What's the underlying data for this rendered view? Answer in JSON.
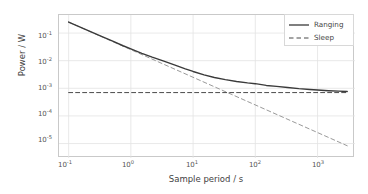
{
  "chart_data": {
    "type": "line",
    "title": "",
    "xlabel": "Sample period / s",
    "ylabel": "Power / W",
    "xscale": "log",
    "yscale": "log",
    "xlim": [
      0.07,
      4000
    ],
    "ylim": [
      3e-06,
      0.45
    ],
    "grid": true,
    "legend_position": "upper right",
    "xticks": [
      0.1,
      1,
      10,
      100,
      1000
    ],
    "xtick_labels": [
      "10⁻¹",
      "10⁰",
      "10¹",
      "10²",
      "10³"
    ],
    "xtick_mantissa": [
      "10",
      "10",
      "10",
      "10",
      "10"
    ],
    "xtick_exponent": [
      "-1",
      "0",
      "1",
      "2",
      "3"
    ],
    "yticks": [
      0.1,
      0.01,
      0.001,
      0.0001,
      1e-05
    ],
    "ytick_labels": [
      "10⁻¹",
      "10⁻²",
      "10⁻³",
      "10⁻⁴",
      "10⁻⁵"
    ],
    "ytick_mantissa": [
      "10",
      "10",
      "10",
      "10",
      "10"
    ],
    "ytick_exponent": [
      "-1",
      "-2",
      "-3",
      "-4",
      "-5"
    ],
    "series": [
      {
        "name": "Ranging",
        "style": "solid",
        "color": "#3a3a3a",
        "x": [
          0.1,
          0.15,
          0.22,
          0.33,
          0.5,
          0.75,
          1.0,
          1.5,
          2.2,
          3.3,
          5.0,
          7.5,
          10.0,
          15.0,
          22.0,
          33.0,
          50.0,
          75.0,
          100.0,
          150.0,
          220.0,
          330.0,
          500.0,
          750.0,
          1000.0,
          1500.0,
          2200.0,
          3000.0
        ],
        "y": [
          0.2507,
          0.1674,
          0.1144,
          0.07692,
          0.0517,
          0.03473,
          0.0267,
          0.0185,
          0.0134,
          0.00977,
          0.00707,
          0.00507,
          0.00407,
          0.00307,
          0.00247,
          0.00207,
          0.00177,
          0.00157,
          0.00147,
          0.00127,
          0.00117,
          0.00107,
          0.00097,
          0.00091,
          0.00087,
          0.00082,
          0.00079,
          0.00077
        ]
      },
      {
        "name": "Sleep",
        "style": "dashed",
        "color": "#4a4a4a",
        "x": [
          0.1,
          3000
        ],
        "y": [
          0.0007,
          0.0007
        ]
      },
      {
        "name": "Ranging asymptote",
        "style": "dashed",
        "color": "#9a9a9a",
        "x": [
          0.1,
          3000
        ],
        "y": [
          0.25,
          8.33e-06
        ]
      }
    ],
    "legend_entries": [
      {
        "label": "Ranging",
        "style": "solid"
      },
      {
        "label": "Sleep",
        "style": "dashed"
      }
    ],
    "annotations": []
  },
  "figure": {
    "background_color": "#ffffff",
    "grid_color": "#e3e3e3",
    "frame_color": "#c9c9c9",
    "text_color": "#4a4a4a"
  }
}
